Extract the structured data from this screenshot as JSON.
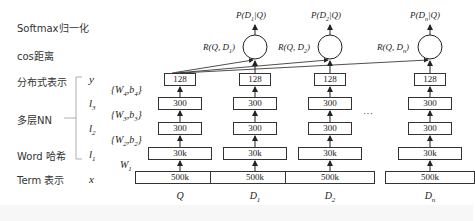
{
  "left_labels": {
    "softmax": "Softmax归一化",
    "cos": "cos距离",
    "distributed": "分布式表示",
    "multilayer": "多层NN",
    "word_hash": "Word 哈希",
    "term": "Term 表示"
  },
  "layer_vars": {
    "y": "y",
    "l3": "l3",
    "l2": "l2",
    "l1": "l1",
    "x": "x"
  },
  "weights": {
    "w4": "{W4,b4}",
    "w3": "{W3,b3}",
    "w2": "{W2,b2}",
    "w1": "W1"
  },
  "columns": [
    {
      "name": "Q",
      "layers": [
        "128",
        "300",
        "300",
        "30k",
        "500k"
      ]
    },
    {
      "name": "D1",
      "layers": [
        "128",
        "300",
        "300",
        "30k",
        "500k"
      ],
      "relevance": "R(Q, D1)",
      "probability": "P(D1|Q)"
    },
    {
      "name": "D2",
      "layers": [
        "128",
        "300",
        "300",
        "30k",
        "500k"
      ],
      "relevance": "R(Q, D2)",
      "probability": "P(D2|Q)"
    },
    {
      "name": "Dn",
      "layers": [
        "128",
        "300",
        "300",
        "30k",
        "500k"
      ],
      "relevance": "R(Q, Dn)",
      "probability": "P(Dn|Q)"
    }
  ],
  "ellipsis": "···"
}
